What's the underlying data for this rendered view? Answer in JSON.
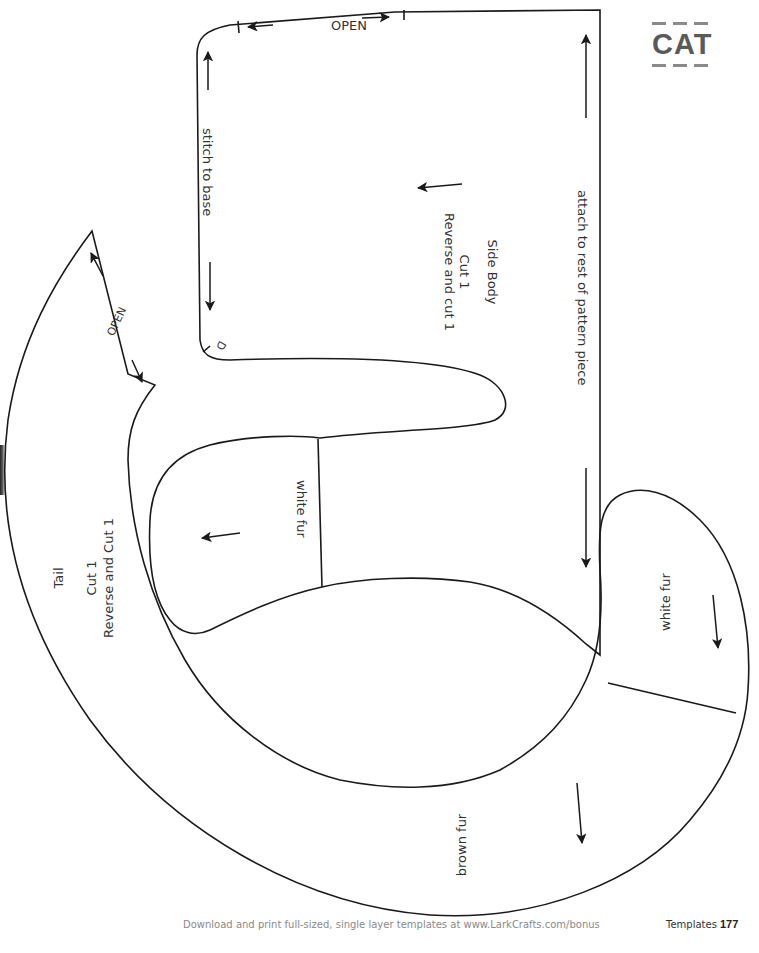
{
  "header": {
    "category_badge": "CAT"
  },
  "pieces": {
    "side_body": {
      "title": "Side Body",
      "cut": "Cut 1",
      "reverse": "Reverse and cut 1",
      "edge_open_label": "OPEN",
      "edge_stitch_label": "stitch to base",
      "edge_attach_label": "attach to rest of pattern piece",
      "notch_label": "D",
      "section_white_fur_label": "white fur"
    },
    "tail": {
      "title": "Tail",
      "cut": "Cut 1",
      "reverse": "Reverse and Cut 1",
      "edge_open_label": "OPEN",
      "section_white_fur_label": "white fur",
      "section_brown_fur_label": "brown fur"
    }
  },
  "colors": {
    "line": "#1a1a1a",
    "text": "#333333",
    "badge": "#5a5a5a",
    "footer_text": "#8a8a8a"
  },
  "footer": {
    "note": "Download and print full-sized, single layer templates at www.LarkCrafts.com/bonus",
    "section": "Templates",
    "page_number": "177"
  }
}
